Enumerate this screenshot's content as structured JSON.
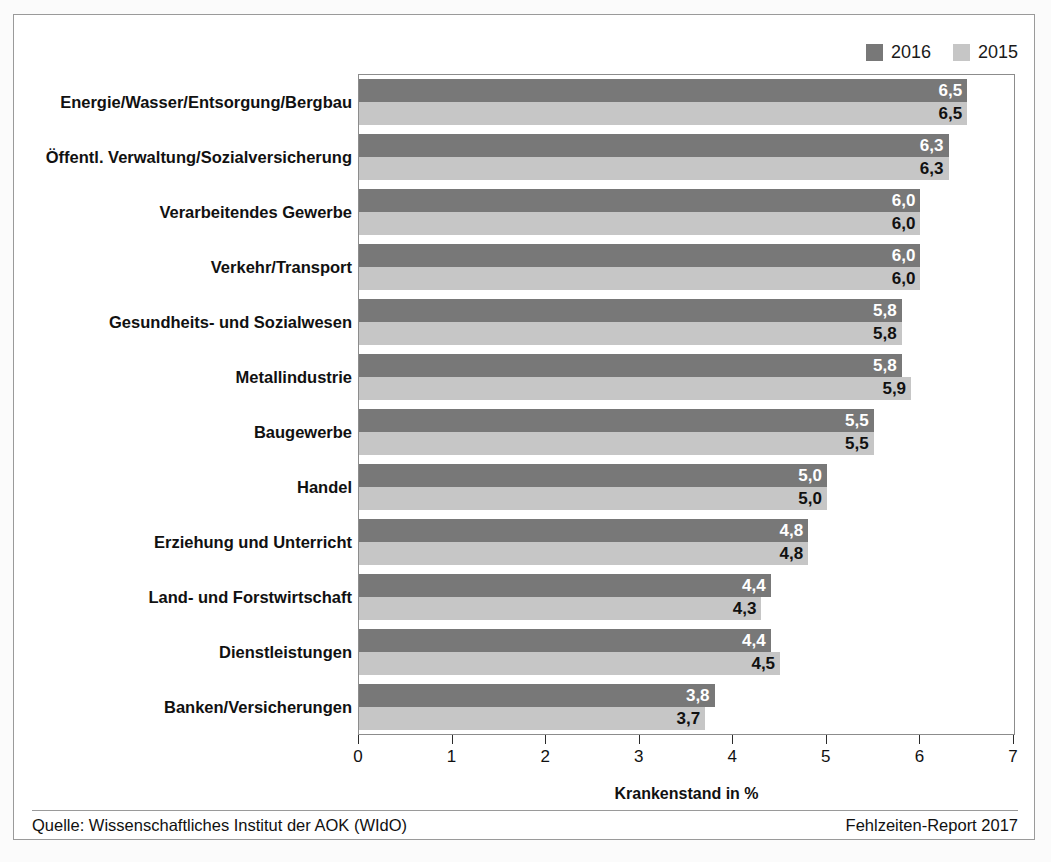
{
  "legend": {
    "items": [
      {
        "label": "2016",
        "color": "#787878",
        "swatch_name": "legend-swatch-2016"
      },
      {
        "label": "2015",
        "color": "#c6c6c6",
        "swatch_name": "legend-swatch-2015"
      }
    ]
  },
  "footer": {
    "source": "Quelle: Wissenschaftliches Institut der AOK (WIdO)",
    "report": "Fehlzeiten-Report 2017"
  },
  "chart_data": {
    "type": "bar",
    "orientation": "horizontal",
    "title": "",
    "subtitle": "",
    "xlabel": "Krankenstand in %",
    "ylabel": "",
    "xlim": [
      0,
      7
    ],
    "xticks": [
      0,
      1,
      2,
      3,
      4,
      5,
      6,
      7
    ],
    "xtick_labels": [
      "0",
      "1",
      "2",
      "3",
      "4",
      "5",
      "6",
      "7"
    ],
    "grid": false,
    "legend_position": "top-right",
    "categories": [
      "Energie/Wasser/Entsorgung/Bergbau",
      "Öffentl. Verwaltung/Sozialversicherung",
      "Verarbeitendes Gewerbe",
      "Verkehr/Transport",
      "Gesundheits- und Sozialwesen",
      "Metallindustrie",
      "Baugewerbe",
      "Handel",
      "Erziehung und Unterricht",
      "Land- und Forstwirtschaft",
      "Dienstleistungen",
      "Banken/Versicherungen"
    ],
    "series": [
      {
        "name": "2016",
        "color": "#787878",
        "values": [
          6.5,
          6.3,
          6.0,
          6.0,
          5.8,
          5.8,
          5.5,
          5.0,
          4.8,
          4.4,
          4.4,
          3.8
        ],
        "labels": [
          "6,5",
          "6,3",
          "6,0",
          "6,0",
          "5,8",
          "5,8",
          "5,5",
          "5,0",
          "4,8",
          "4,4",
          "4,4",
          "3,8"
        ]
      },
      {
        "name": "2015",
        "color": "#c6c6c6",
        "values": [
          6.5,
          6.3,
          6.0,
          6.0,
          5.8,
          5.9,
          5.5,
          5.0,
          4.8,
          4.3,
          4.5,
          3.7
        ],
        "labels": [
          "6,5",
          "6,3",
          "6,0",
          "6,0",
          "5,8",
          "5,9",
          "5,5",
          "5,0",
          "4,8",
          "4,3",
          "4,5",
          "3,7"
        ]
      }
    ]
  }
}
